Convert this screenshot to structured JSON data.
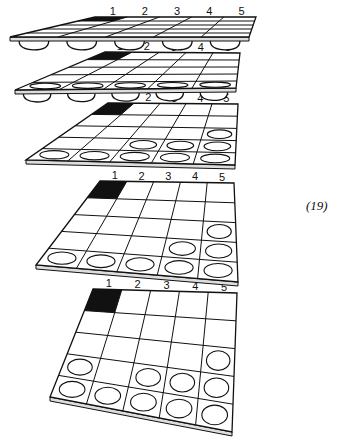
{
  "figure": {
    "number_label": "(19)",
    "column_labels": [
      "1",
      "2",
      "3",
      "4",
      "5"
    ],
    "colors": {
      "ink": "#111111",
      "paper": "#ffffff",
      "edge": "#cccccc"
    },
    "grid": {
      "rows": 5,
      "cols": 5
    },
    "boards": [
      {
        "name": "board-1",
        "shaded": [
          [
            0,
            0
          ]
        ],
        "cups": [
          [
            4,
            0
          ],
          [
            4,
            1
          ],
          [
            4,
            2
          ],
          [
            4,
            3
          ],
          [
            4,
            4
          ]
        ],
        "cup_style": "below"
      },
      {
        "name": "board-2",
        "shaded": [
          [
            0,
            0
          ]
        ],
        "cups": [
          [
            4,
            0
          ],
          [
            4,
            1
          ],
          [
            4,
            2
          ],
          [
            4,
            3
          ],
          [
            4,
            4
          ]
        ],
        "cup_style": "flat"
      },
      {
        "name": "board-3",
        "shaded": [
          [
            0,
            0
          ]
        ],
        "cups": [
          [
            2,
            4
          ],
          [
            3,
            2
          ],
          [
            3,
            3
          ],
          [
            3,
            4
          ],
          [
            4,
            0
          ],
          [
            4,
            1
          ],
          [
            4,
            2
          ],
          [
            4,
            3
          ],
          [
            4,
            4
          ]
        ],
        "cup_style": "circle"
      },
      {
        "name": "board-4",
        "shaded": [
          [
            0,
            0
          ]
        ],
        "cups": [
          [
            2,
            4
          ],
          [
            3,
            3
          ],
          [
            3,
            4
          ],
          [
            4,
            0
          ],
          [
            4,
            1
          ],
          [
            4,
            2
          ],
          [
            4,
            3
          ],
          [
            4,
            4
          ]
        ],
        "cup_style": "circle"
      },
      {
        "name": "board-5",
        "shaded": [
          [
            0,
            0
          ]
        ],
        "cups": [
          [
            2,
            4
          ],
          [
            3,
            0
          ],
          [
            3,
            2
          ],
          [
            3,
            3
          ],
          [
            3,
            4
          ],
          [
            4,
            0
          ],
          [
            4,
            1
          ],
          [
            4,
            2
          ],
          [
            4,
            3
          ],
          [
            4,
            4
          ]
        ],
        "cup_style": "circle"
      }
    ]
  }
}
